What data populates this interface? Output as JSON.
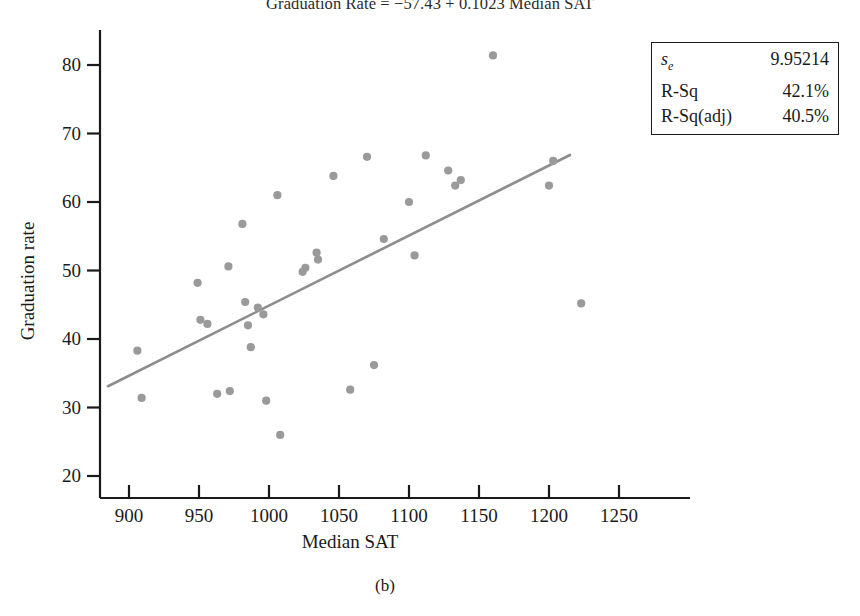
{
  "title": "Graduation Rate = −57.43 + 0.1023 Median SAT",
  "caption": "(b)",
  "axes": {
    "x_label": "Median SAT",
    "y_label": "Graduation rate",
    "x_ticks": [
      900,
      950,
      1000,
      1050,
      1100,
      1150,
      1200,
      1250
    ],
    "y_ticks": [
      20,
      30,
      40,
      50,
      60,
      70,
      80
    ]
  },
  "stats": {
    "rows": [
      {
        "label": "s",
        "sub": "e",
        "value": "9.95214"
      },
      {
        "label": "R-Sq",
        "sub": "",
        "value": "42.1%"
      },
      {
        "label": "R-Sq(adj)",
        "sub": "",
        "value": "40.5%"
      }
    ]
  },
  "colors": {
    "point": "#9a9a9a",
    "line": "#8d8d8d",
    "axis": "#1a1a1a",
    "text": "#1a1a1a",
    "background": "#ffffff"
  },
  "chart_data": {
    "type": "scatter",
    "title": "Graduation Rate = −57.43 + 0.1023 Median SAT",
    "xlabel": "Median SAT",
    "ylabel": "Graduation rate",
    "xlim": [
      880,
      1270
    ],
    "ylim": [
      17,
      84
    ],
    "grid": false,
    "legend": "none",
    "x_ticks": [
      900,
      950,
      1000,
      1050,
      1100,
      1150,
      1200,
      1250
    ],
    "y_ticks": [
      20,
      30,
      40,
      50,
      60,
      70,
      80
    ],
    "points": [
      {
        "x": 906,
        "y": 38.3
      },
      {
        "x": 909,
        "y": 31.4
      },
      {
        "x": 949,
        "y": 48.2
      },
      {
        "x": 951,
        "y": 42.8
      },
      {
        "x": 956,
        "y": 42.2
      },
      {
        "x": 963,
        "y": 32.0
      },
      {
        "x": 971,
        "y": 50.6
      },
      {
        "x": 972,
        "y": 32.4
      },
      {
        "x": 981,
        "y": 56.8
      },
      {
        "x": 983,
        "y": 45.4
      },
      {
        "x": 985,
        "y": 42.0
      },
      {
        "x": 987,
        "y": 38.8
      },
      {
        "x": 992,
        "y": 44.6
      },
      {
        "x": 996,
        "y": 43.6
      },
      {
        "x": 998,
        "y": 31.0
      },
      {
        "x": 1006,
        "y": 61.0
      },
      {
        "x": 1008,
        "y": 26.0
      },
      {
        "x": 1024,
        "y": 49.8
      },
      {
        "x": 1026,
        "y": 50.4
      },
      {
        "x": 1034,
        "y": 52.6
      },
      {
        "x": 1035,
        "y": 51.6
      },
      {
        "x": 1046,
        "y": 63.8
      },
      {
        "x": 1058,
        "y": 32.6
      },
      {
        "x": 1070,
        "y": 66.6
      },
      {
        "x": 1075,
        "y": 36.2
      },
      {
        "x": 1082,
        "y": 54.6
      },
      {
        "x": 1100,
        "y": 60.0
      },
      {
        "x": 1104,
        "y": 52.2
      },
      {
        "x": 1112,
        "y": 66.8
      },
      {
        "x": 1128,
        "y": 64.6
      },
      {
        "x": 1133,
        "y": 62.4
      },
      {
        "x": 1137,
        "y": 63.2
      },
      {
        "x": 1160,
        "y": 81.4
      },
      {
        "x": 1200,
        "y": 62.4
      },
      {
        "x": 1203,
        "y": 66.0
      },
      {
        "x": 1223,
        "y": 45.2
      }
    ],
    "fit_line": {
      "intercept": -57.43,
      "slope": 0.1023,
      "x_start": 885,
      "x_end": 1215
    },
    "annotations": {
      "s_e": "9.95214",
      "R-Sq": "42.1%",
      "R-Sq(adj)": "40.5%"
    }
  }
}
